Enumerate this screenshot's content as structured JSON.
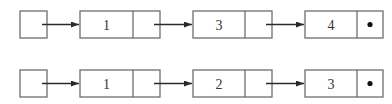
{
  "lists": [
    {
      "name": "list-a",
      "nodes": [
        {
          "value": "1",
          "next": "pointer"
        },
        {
          "value": "3",
          "next": "pointer"
        },
        {
          "value": "4",
          "next": "null"
        }
      ]
    },
    {
      "name": "list-b",
      "nodes": [
        {
          "value": "1",
          "next": "pointer"
        },
        {
          "value": "2",
          "next": "pointer"
        },
        {
          "value": "3",
          "next": "null"
        }
      ]
    }
  ],
  "colors": {
    "border": "#6e6e6e",
    "arrow": "#2a2a2a",
    "null_dot": "#111111"
  }
}
